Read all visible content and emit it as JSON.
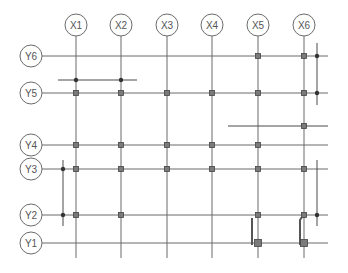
{
  "diagram": {
    "type": "structural-grid-plan",
    "colors": {
      "line": "#6b6b6b",
      "column": "#7a7a7a",
      "text": "#555555"
    },
    "x_axes": [
      {
        "label": "X1",
        "x": 76
      },
      {
        "label": "X2",
        "x": 121
      },
      {
        "label": "X3",
        "x": 167
      },
      {
        "label": "X4",
        "x": 212
      },
      {
        "label": "X5",
        "x": 258
      },
      {
        "label": "X6",
        "x": 304
      }
    ],
    "y_axes": [
      {
        "label": "Y6",
        "y": 56
      },
      {
        "label": "Y5",
        "y": 93
      },
      {
        "label": "Y4",
        "y": 145
      },
      {
        "label": "Y3",
        "y": 169
      },
      {
        "label": "Y2",
        "y": 215
      },
      {
        "label": "Y1",
        "y": 243
      }
    ],
    "columns": [
      [
        "X5",
        "Y6"
      ],
      [
        "X6",
        "Y6"
      ],
      [
        "X1",
        "Y5"
      ],
      [
        "X2",
        "Y5"
      ],
      [
        "X3",
        "Y5"
      ],
      [
        "X4",
        "Y5"
      ],
      [
        "X5",
        "Y5"
      ],
      [
        "X6",
        "Y5"
      ],
      [
        "X6",
        "Y4.5"
      ],
      [
        "X1",
        "Y4"
      ],
      [
        "X2",
        "Y4"
      ],
      [
        "X3",
        "Y4"
      ],
      [
        "X4",
        "Y4"
      ],
      [
        "X5",
        "Y4"
      ],
      [
        "X1",
        "Y3"
      ],
      [
        "X2",
        "Y3"
      ],
      [
        "X3",
        "Y3"
      ],
      [
        "X4",
        "Y3"
      ],
      [
        "X5",
        "Y3"
      ],
      [
        "X6",
        "Y3"
      ],
      [
        "X1",
        "Y2"
      ],
      [
        "X2",
        "Y2"
      ],
      [
        "X5",
        "Y2"
      ],
      [
        "X6",
        "Y2"
      ],
      [
        "X5",
        "Y1"
      ],
      [
        "X6",
        "Y1"
      ]
    ]
  }
}
